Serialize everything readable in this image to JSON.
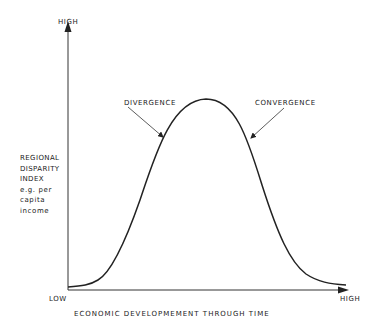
{
  "diagram": {
    "type": "curve",
    "y_axis": {
      "high_label": "HIGH",
      "title_lines": [
        "REGIONAL",
        "DISPARITY",
        "INDEX",
        "e.g. per",
        "capita",
        "income"
      ]
    },
    "x_axis": {
      "low_label": "LOW",
      "high_label": "HIGH",
      "title": "ECONOMIC DEVELOPMEMENT THROUGH TIME"
    },
    "annotations": {
      "rising": "DIVERGENCE",
      "falling": "CONVERGENCE"
    },
    "colors": {
      "line": "#222222",
      "background": "#ffffff"
    }
  }
}
